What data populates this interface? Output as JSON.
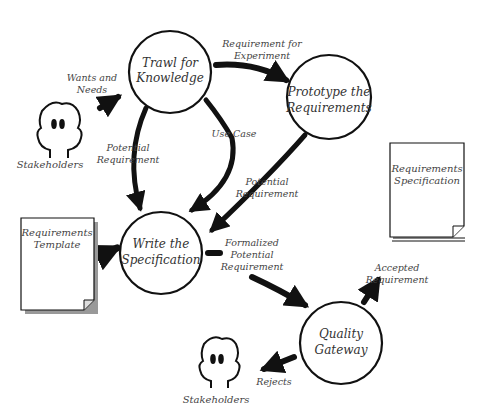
{
  "diagram": {
    "title": "",
    "processes": [
      {
        "id": "trawl",
        "line1": "Trawl for",
        "line2": "Knowledge"
      },
      {
        "id": "prototype",
        "line1": "Prototype the",
        "line2": "Requirements"
      },
      {
        "id": "write",
        "line1": "Write the",
        "line2": "Specification"
      },
      {
        "id": "quality",
        "line1": "Quality",
        "line2": "Gateway"
      }
    ],
    "actors": [
      {
        "id": "stakeholders_top",
        "label": "Stakeholders"
      },
      {
        "id": "stakeholders_bottom",
        "label": "Stakeholders"
      }
    ],
    "documents": [
      {
        "id": "template",
        "line1": "Requirements",
        "line2": "Template"
      },
      {
        "id": "spec",
        "line1": "Requirements",
        "line2": "Specification"
      }
    ],
    "flows": [
      {
        "id": "wants",
        "line1": "Wants and",
        "line2": "Needs"
      },
      {
        "id": "req_experiment",
        "line1": "Requirement for",
        "line2": "Experiment"
      },
      {
        "id": "use_case",
        "line1": "Use Case"
      },
      {
        "id": "potential_left",
        "line1": "Potential",
        "line2": "Requirement"
      },
      {
        "id": "potential_right",
        "line1": "Potential",
        "line2": "Requirement"
      },
      {
        "id": "formalized",
        "line1": "Formalized",
        "line2": "Potential",
        "line3": "Requirement"
      },
      {
        "id": "accepted",
        "line1": "Accepted",
        "line2": "Requirement"
      },
      {
        "id": "rejects",
        "line1": "Rejects"
      }
    ]
  }
}
